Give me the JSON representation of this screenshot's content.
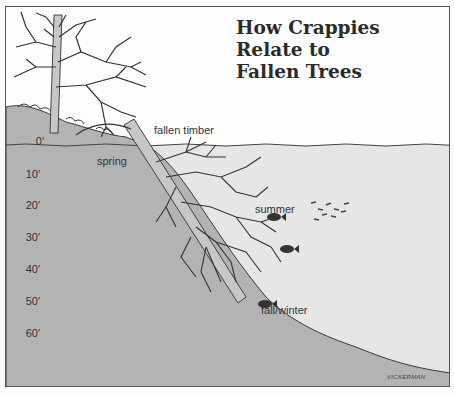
{
  "figure": {
    "title_line1": "How Crappies Relate to",
    "title_line2": "Fallen Trees",
    "colors": {
      "water": "#e6e6e6",
      "bottom": "#b3b3b3",
      "line": "#3a3a3a",
      "sky": "#fdfdfd"
    }
  },
  "labels": {
    "fallen_timber": "fallen timber",
    "spring": "spring",
    "summer": "summer",
    "fall_winter": "fall/winter"
  },
  "depth_scale": {
    "unit": "feet",
    "ticks": [
      "0'",
      "10'",
      "20'",
      "30'",
      "40'",
      "50'",
      "60'"
    ]
  },
  "signature": "VICKERMAN"
}
